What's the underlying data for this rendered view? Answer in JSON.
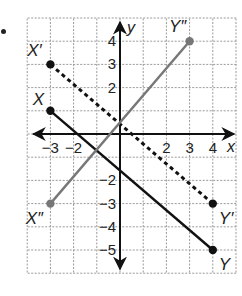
{
  "figure": {
    "bullet": "•",
    "axes": {
      "x_label": "x",
      "y_label": "y",
      "x_range": [
        -4,
        5
      ],
      "y_range": [
        -6,
        5
      ],
      "x_tick_labels": [
        {
          "value": -3,
          "text": "−3"
        },
        {
          "value": -2,
          "text": "−2"
        },
        {
          "value": 2,
          "text": "2"
        },
        {
          "value": 3,
          "text": "3"
        },
        {
          "value": 4,
          "text": "4"
        }
      ],
      "y_tick_labels": [
        {
          "value": 4,
          "text": "4"
        },
        {
          "value": 3,
          "text": "3"
        },
        {
          "value": 2,
          "text": "2"
        },
        {
          "value": -2,
          "text": "−2"
        },
        {
          "value": -3,
          "text": "−3"
        },
        {
          "value": -4,
          "text": "−4"
        },
        {
          "value": -5,
          "text": "−5"
        }
      ]
    },
    "segments": [
      {
        "name": "XY",
        "style": "solid",
        "color": "#111111",
        "start": {
          "label": "X",
          "x": -3,
          "y": 1
        },
        "end": {
          "label": "Y",
          "x": 4,
          "y": -5
        }
      },
      {
        "name": "X'Y'",
        "style": "dashed",
        "color": "#111111",
        "start": {
          "label": "X′",
          "x": -3,
          "y": 3
        },
        "end": {
          "label": "Y′",
          "x": 4,
          "y": -3
        }
      },
      {
        "name": "X''Y''",
        "style": "solid",
        "color": "#777777",
        "start": {
          "label": "X″",
          "x": -3,
          "y": -3
        },
        "end": {
          "label": "Y″",
          "x": 3,
          "y": 4
        }
      }
    ],
    "colors": {
      "grid": "#9a9a9a",
      "axis": "#111111",
      "background": "#ffffff"
    }
  }
}
